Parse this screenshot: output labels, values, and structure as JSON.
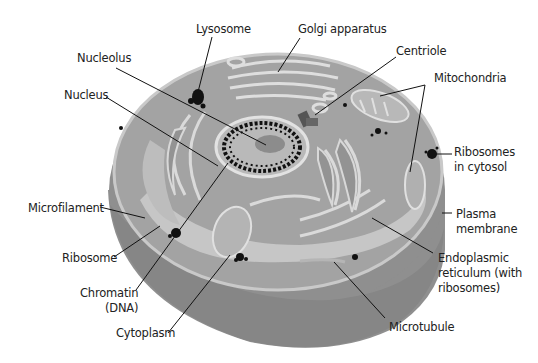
{
  "diagram": {
    "type": "animal-cell-cross-section",
    "colors": {
      "background": "#ffffff",
      "cell_outer": "#8e8e8e",
      "cell_side": "#9a9a9a",
      "cytoplasm": "#a8a8a8",
      "organelle_fill": "#909090",
      "membrane_highlight": "#dcdcdc",
      "light_region": "#c4c4c4",
      "nucleus": "#9e9e9e",
      "chromatin": "#111111",
      "leader_line": "#111111",
      "text": "#222222"
    },
    "labels": [
      {
        "id": "lysosome",
        "text": "Lysosome",
        "x": 196,
        "y": 22
      },
      {
        "id": "golgi",
        "text": "Golgi apparatus",
        "x": 298,
        "y": 22
      },
      {
        "id": "centriole",
        "text": "Centriole",
        "x": 396,
        "y": 44
      },
      {
        "id": "nucleolus",
        "text": "Nucleolus",
        "x": 77,
        "y": 51
      },
      {
        "id": "mitochondria",
        "text": "Mitochondria",
        "x": 434,
        "y": 71
      },
      {
        "id": "nucleus",
        "text": "Nucleus",
        "x": 64,
        "y": 88
      },
      {
        "id": "ribosomes-cytosol",
        "text": "Ribosomes\nin cytosol",
        "x": 454,
        "y": 145
      },
      {
        "id": "microfilament",
        "text": "Microfilament",
        "x": 28,
        "y": 201
      },
      {
        "id": "plasma-membrane",
        "text": "Plasma\nmembrane",
        "x": 456,
        "y": 207
      },
      {
        "id": "ribosome",
        "text": "Ribosome",
        "x": 62,
        "y": 251
      },
      {
        "id": "endoplasmic-reticulum",
        "text": "Endoplasmic\nreticulum (with\nribosomes)",
        "x": 438,
        "y": 251
      },
      {
        "id": "chromatin",
        "text": "Chromatin\n(DNA)",
        "x": 80,
        "y": 286
      },
      {
        "id": "cytoplasm",
        "text": "Cytoplasm",
        "x": 116,
        "y": 326
      },
      {
        "id": "microtubule",
        "text": "Microtubule",
        "x": 389,
        "y": 320
      }
    ]
  }
}
